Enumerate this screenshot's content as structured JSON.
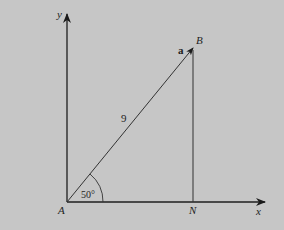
{
  "diagram": {
    "type": "right-triangle-vector",
    "points": {
      "origin": "A",
      "tip": "B",
      "foot": "N"
    },
    "labels": {
      "y_axis": "y",
      "x_axis": "x",
      "point_A": "A",
      "point_B": "B",
      "point_N": "N",
      "vector": "a",
      "magnitude": "9",
      "angle": "50°"
    },
    "values": {
      "magnitude": 9,
      "angle_degrees": 50
    },
    "colors": {
      "background": "#c6c6c6",
      "line": "#2a2a2a"
    }
  }
}
